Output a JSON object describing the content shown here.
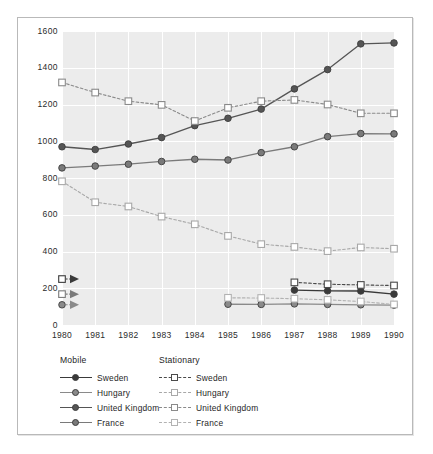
{
  "chart_data": {
    "type": "line",
    "title": "",
    "xlabel": "",
    "ylabel": "NOx (thousand tonnes/year)",
    "ylabel_base": "NO",
    "ylabel_sub": "x",
    "ylabel_rest": " (thousand tonnes/year)",
    "x": [
      1980,
      1981,
      1982,
      1983,
      1984,
      1985,
      1986,
      1987,
      1988,
      1989,
      1990
    ],
    "xticklabels": [
      "1980",
      "1981",
      "1982",
      "1983",
      "1984",
      "1985",
      "1986",
      "1987",
      "1988",
      "1989",
      "1990"
    ],
    "yticks": [
      0,
      200,
      400,
      600,
      800,
      1000,
      1200,
      1400,
      1600
    ],
    "yticklabels": [
      "0",
      "200",
      "400",
      "600",
      "800",
      "1000",
      "1200",
      "1400",
      "1600"
    ],
    "ylim": [
      0,
      1600
    ],
    "xlim": [
      1980,
      1990
    ],
    "grid": true,
    "grid_color": "#ffffff",
    "plot_background": "#ececec",
    "legend_position": "below-axes",
    "series": [
      {
        "name": "United Kingdom",
        "group": "Mobile",
        "style": "solid",
        "marker": "filled-circle",
        "color": "#555555",
        "x": [
          1980,
          1981,
          1982,
          1983,
          1984,
          1985,
          1986,
          1987,
          1988,
          1989,
          1990
        ],
        "values": [
          970,
          955,
          985,
          1020,
          1085,
          1125,
          1175,
          1285,
          1390,
          1530,
          1535
        ]
      },
      {
        "name": "France",
        "group": "Mobile",
        "style": "solid",
        "marker": "filled-circle",
        "color": "#7a7a7a",
        "x": [
          1980,
          1981,
          1982,
          1983,
          1984,
          1985,
          1986,
          1987,
          1988,
          1989,
          1990
        ],
        "values": [
          855,
          865,
          875,
          890,
          902,
          898,
          938,
          970,
          1025,
          1042,
          1040
        ]
      },
      {
        "name": "Sweden",
        "group": "Mobile",
        "style": "solid",
        "marker": "filled-circle",
        "color": "#3a3a3a",
        "x": [
          1987,
          1988,
          1989,
          1990
        ],
        "values": [
          190,
          186,
          185,
          168
        ]
      },
      {
        "name": "Hungary",
        "group": "Mobile",
        "style": "solid",
        "marker": "filled-circle",
        "color": "#8a8a8a",
        "x": [
          1985,
          1986,
          1987,
          1988,
          1989,
          1990
        ],
        "values": [
          113,
          112,
          115,
          112,
          110,
          108
        ]
      },
      {
        "name": "United Kingdom",
        "group": "Stationary",
        "style": "dashed",
        "marker": "open-square",
        "color": "#8a8a8a",
        "x": [
          1980,
          1981,
          1982,
          1983,
          1984,
          1985,
          1986,
          1987,
          1988,
          1989,
          1990
        ],
        "values": [
          1320,
          1265,
          1218,
          1198,
          1110,
          1182,
          1218,
          1225,
          1200,
          1152,
          1152
        ]
      },
      {
        "name": "Hungary",
        "group": "Stationary",
        "style": "dashed",
        "marker": "open-square",
        "color": "#a8a8a8",
        "x": [
          1980,
          1981,
          1982,
          1983,
          1984,
          1985,
          1986,
          1987,
          1988,
          1989,
          1990
        ],
        "values": [
          782,
          668,
          645,
          590,
          548,
          485,
          440,
          425,
          402,
          422,
          415
        ]
      },
      {
        "name": "Sweden",
        "group": "Stationary",
        "style": "dashed",
        "marker": "open-square",
        "color": "#4a4a4a",
        "x": [
          1987,
          1988,
          1989,
          1990
        ],
        "values": [
          232,
          222,
          218,
          215
        ]
      },
      {
        "name": "France",
        "group": "Stationary",
        "style": "dashed",
        "marker": "open-square",
        "color": "#b2b2b2",
        "x": [
          1985,
          1986,
          1987,
          1988,
          1989,
          1990
        ],
        "values": [
          148,
          147,
          143,
          137,
          128,
          112
        ]
      }
    ],
    "annotations": [
      {
        "name": "arrow-sweden-stationary",
        "y": 250,
        "color": "#3a3a3a",
        "marker": "open-square"
      },
      {
        "name": "arrow-sweden-mobile",
        "y": 168,
        "color": "#7a7a7a",
        "marker": "open-square"
      },
      {
        "name": "arrow-hungary-mobile",
        "y": 110,
        "color": "#8a8a8a",
        "marker": "filled-circle"
      }
    ]
  },
  "legend": {
    "mobile": {
      "heading": "Mobile",
      "items": [
        {
          "label": "Sweden",
          "color": "#3a3a3a",
          "style": "solid",
          "marker": "filled-circle"
        },
        {
          "label": "Hungary",
          "color": "#8a8a8a",
          "style": "solid",
          "marker": "filled-circle"
        },
        {
          "label": "United Kingdom",
          "color": "#555555",
          "style": "solid",
          "marker": "filled-circle"
        },
        {
          "label": "France",
          "color": "#7a7a7a",
          "style": "solid",
          "marker": "filled-circle"
        }
      ]
    },
    "stationary": {
      "heading": "Stationary",
      "items": [
        {
          "label": "Sweden",
          "color": "#4a4a4a",
          "style": "dashed",
          "marker": "open-square"
        },
        {
          "label": "Hungary",
          "color": "#a8a8a8",
          "style": "dashed",
          "marker": "open-square"
        },
        {
          "label": "United Kingdom",
          "color": "#8a8a8a",
          "style": "dashed",
          "marker": "open-square"
        },
        {
          "label": "France",
          "color": "#b2b2b2",
          "style": "dashed",
          "marker": "open-square"
        }
      ]
    }
  }
}
